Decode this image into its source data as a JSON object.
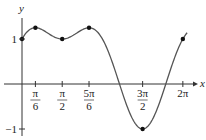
{
  "chart_data": {
    "type": "line",
    "title": "",
    "xlabel": "x",
    "ylabel": "y",
    "function": "sin x + cos^2 x",
    "xlim": [
      0,
      6.2832
    ],
    "ylim": [
      -1,
      1.25
    ],
    "grid": false,
    "legend": null,
    "x_ticks": [
      {
        "value": 0.5236,
        "num": "π",
        "den": "6"
      },
      {
        "value": 1.5708,
        "num": "π",
        "den": "2"
      },
      {
        "value": 2.618,
        "num": "5π",
        "den": "6"
      },
      {
        "value": 4.7124,
        "num": "3π",
        "den": "2"
      },
      {
        "value": 6.2832,
        "label": "2π"
      }
    ],
    "y_ticks": [
      {
        "value": 1,
        "label": "1"
      },
      {
        "value": -1,
        "label": "−1"
      }
    ],
    "marked_points": [
      {
        "x": 0,
        "y": 1
      },
      {
        "x": 0.5236,
        "y": 1.25
      },
      {
        "x": 1.5708,
        "y": 1
      },
      {
        "x": 2.618,
        "y": 1.25
      },
      {
        "x": 4.7124,
        "y": -1
      },
      {
        "x": 6.2832,
        "y": 1
      }
    ],
    "colors": {
      "curve": "#555555",
      "axes": "#333333",
      "points": "#111111"
    }
  }
}
